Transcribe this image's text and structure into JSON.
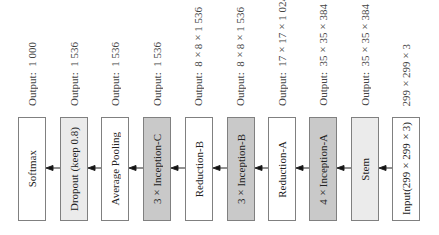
{
  "diagram": {
    "direction": "right-to-left",
    "columns": [
      {
        "box_label": "Softmax",
        "output_label": "Output:  1 000",
        "fill": "white"
      },
      {
        "box_label": "Dropout (keep 0.8)",
        "output_label": "Output:  1 536",
        "fill": "light"
      },
      {
        "box_label": "Average Pooling",
        "output_label": "Output:  1 536",
        "fill": "white"
      },
      {
        "box_label": "3×Inception-C",
        "output_label": "Output:  1 536",
        "fill": "dark"
      },
      {
        "box_label": "Reduction-B",
        "output_label": "Output:  8×8×1 536",
        "fill": "white"
      },
      {
        "box_label": "3×Inception-B",
        "output_label": "Output:  8×8×1 536",
        "fill": "dark"
      },
      {
        "box_label": "Reduction-A",
        "output_label": "Output:  17×17×1 024",
        "fill": "white"
      },
      {
        "box_label": "4×Inception-A",
        "output_label": "Output:  35×35×384",
        "fill": "dark"
      },
      {
        "box_label": "Stem",
        "output_label": "Output:  35×35×384",
        "fill": "light"
      },
      {
        "box_label": "Input(299×299×3)",
        "output_label": "299×299×3",
        "fill": "white"
      }
    ],
    "colors": {
      "white": "#ffffff",
      "light": "#ebebeb",
      "dark": "#c9c9c9",
      "border": "#808080"
    }
  }
}
